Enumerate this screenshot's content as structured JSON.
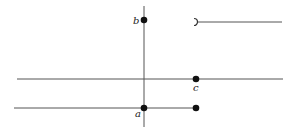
{
  "diagram": {
    "colors": {
      "line": "#555555",
      "point": "#111111",
      "background": "#ffffff"
    },
    "lines": [
      {
        "name": "vertical-axis",
        "x1": 144,
        "y1": 6,
        "x2": 144,
        "y2": 127
      },
      {
        "name": "middle-horizontal-line",
        "x1": 17,
        "y1": 79,
        "x2": 283,
        "y2": 79
      },
      {
        "name": "bottom-segment",
        "x1": 14,
        "y1": 108,
        "x2": 196,
        "y2": 108
      },
      {
        "name": "top-right-ray",
        "x1": 198,
        "y1": 22,
        "x2": 282,
        "y2": 22
      }
    ],
    "points": [
      {
        "name": "point-b",
        "cx": 144,
        "cy": 20,
        "filled": true
      },
      {
        "name": "point-c",
        "cx": 196,
        "cy": 79,
        "filled": true
      },
      {
        "name": "point-a",
        "cx": 144,
        "cy": 108,
        "filled": true
      },
      {
        "name": "point-bottom-right",
        "cx": 196,
        "cy": 108,
        "filled": true
      }
    ],
    "open_endpoint": {
      "name": "open-endpoint-marker",
      "x": 196,
      "y": 22
    },
    "labels": {
      "b": "b",
      "c": "c",
      "a": "a"
    }
  }
}
